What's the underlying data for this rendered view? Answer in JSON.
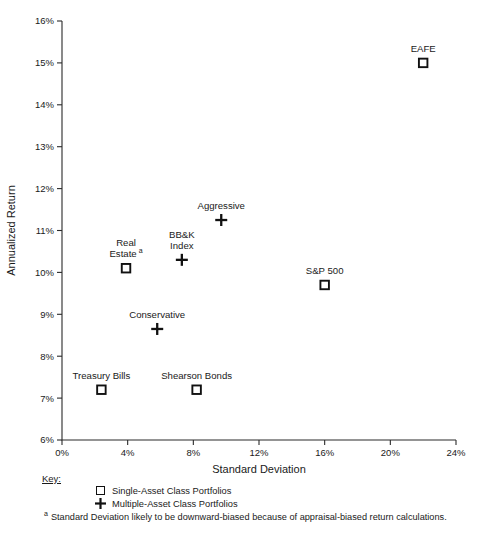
{
  "chart_data": {
    "type": "scatter",
    "title": "",
    "xlabel": "Standard Deviation",
    "ylabel": "Annualized Return",
    "xlim": [
      0,
      24
    ],
    "ylim": [
      6,
      16
    ],
    "xticks": [
      0,
      4,
      8,
      12,
      16,
      20,
      24
    ],
    "yticks": [
      6,
      7,
      8,
      9,
      10,
      11,
      12,
      13,
      14,
      15,
      16
    ],
    "xticklabels": [
      "0%",
      "4%",
      "8%",
      "12%",
      "16%",
      "20%",
      "24%"
    ],
    "yticklabels": [
      "6%",
      "7%",
      "8%",
      "9%",
      "10%",
      "11%",
      "12%",
      "13%",
      "14%",
      "15%",
      "16%"
    ],
    "grid": false,
    "legend_position": "below-axis-left",
    "series": [
      {
        "name": "Single-Asset Class Portfolios",
        "marker": "square",
        "points": [
          {
            "label": "EAFE",
            "x": 22.0,
            "y": 15.0,
            "label_lines": [
              "EAFE"
            ],
            "label_dy": -11,
            "superscript": ""
          },
          {
            "label": "S&P 500",
            "x": 16.0,
            "y": 9.7,
            "label_lines": [
              "S&P 500"
            ],
            "label_dy": -11,
            "superscript": ""
          },
          {
            "label": "Real Estate",
            "x": 3.9,
            "y": 10.1,
            "label_lines": [
              "Real",
              "Estate"
            ],
            "label_dy": -22,
            "superscript": "a"
          },
          {
            "label": "Treasury Bills",
            "x": 2.4,
            "y": 7.2,
            "label_lines": [
              "Treasury Bills"
            ],
            "label_dy": -11,
            "superscript": ""
          },
          {
            "label": "Shearson Bonds",
            "x": 8.2,
            "y": 7.2,
            "label_lines": [
              "Shearson Bonds"
            ],
            "label_dy": -11,
            "superscript": ""
          }
        ]
      },
      {
        "name": "Multiple-Asset Class Portfolios",
        "marker": "plus",
        "points": [
          {
            "label": "Aggressive",
            "x": 9.7,
            "y": 11.25,
            "label_lines": [
              "Aggressive"
            ],
            "label_dy": -11,
            "superscript": ""
          },
          {
            "label": "BB&K Index",
            "x": 7.3,
            "y": 10.3,
            "label_lines": [
              "BB&K",
              "Index"
            ],
            "label_dy": -22,
            "superscript": ""
          },
          {
            "label": "Conservative",
            "x": 5.8,
            "y": 8.65,
            "label_lines": [
              "Conservative"
            ],
            "label_dy": -11,
            "superscript": ""
          }
        ]
      }
    ]
  },
  "axes": {
    "x_title": "Standard Deviation",
    "y_title": "Annualized Return"
  },
  "key": {
    "title": "Key:",
    "entries": [
      {
        "glyph": "square",
        "label": "Single-Asset Class Portfolios"
      },
      {
        "glyph": "plus",
        "label": "Multiple-Asset Class Portfolios"
      }
    ]
  },
  "footnote": {
    "marker": "a",
    "text": "Standard Deviation likely to be downward-biased because of appraisal-biased return calculations."
  },
  "colors": {
    "ink": "#111111",
    "axis": "#2b2b2b",
    "background": "#ffffff"
  }
}
